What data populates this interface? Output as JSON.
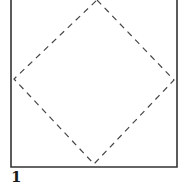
{
  "diagram": {
    "step_number": "1",
    "square": {
      "left": 11,
      "right": 177,
      "top": -2,
      "bottom": 167,
      "stroke": "#333333"
    },
    "fold_line": {
      "style": "dashed",
      "points": [
        [
          97,
          0
        ],
        [
          174,
          80
        ],
        [
          94,
          164
        ],
        [
          14,
          79
        ]
      ],
      "stroke": "#444444"
    }
  }
}
